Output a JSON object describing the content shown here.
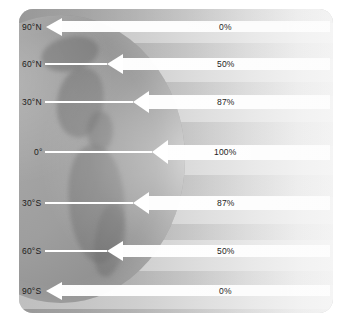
{
  "diagram": {
    "panel": {
      "corner_radius_px": 14
    },
    "globe": {
      "name": "earth-hemisphere"
    },
    "latitudes": [
      {
        "id": "90N",
        "label": "90°N",
        "y": 27,
        "label_x": 22,
        "line_x": 46,
        "line_w": 0,
        "beam_y": 21,
        "beam_h": 11,
        "tip_x": 46,
        "beam_x": 62,
        "beam_w": 268,
        "head_w": 16,
        "head_h": 9,
        "percent": "0%",
        "pct_x": 219,
        "pct_y": 27
      },
      {
        "id": "60N",
        "label": "60°N",
        "y": 64,
        "label_x": 22,
        "line_x": 45,
        "line_w": 62,
        "beam_y": 58,
        "beam_h": 12,
        "tip_x": 107,
        "beam_x": 123,
        "beam_w": 207,
        "head_w": 16,
        "head_h": 10,
        "percent": "50%",
        "pct_x": 217,
        "pct_y": 64
      },
      {
        "id": "30N",
        "label": "30°N",
        "y": 102,
        "label_x": 22,
        "line_x": 45,
        "line_w": 88,
        "beam_y": 95,
        "beam_h": 14,
        "tip_x": 133,
        "beam_x": 149,
        "beam_w": 181,
        "head_w": 16,
        "head_h": 11,
        "percent": "87%",
        "pct_x": 217,
        "pct_y": 102
      },
      {
        "id": "0",
        "label": "0°",
        "y": 152,
        "label_x": 34,
        "line_x": 45,
        "line_w": 107,
        "beam_y": 145,
        "beam_h": 15,
        "tip_x": 152,
        "beam_x": 168,
        "beam_w": 162,
        "head_w": 16,
        "head_h": 12,
        "percent": "100%",
        "pct_x": 214,
        "pct_y": 152
      },
      {
        "id": "30S",
        "label": "30°S",
        "y": 203,
        "label_x": 22,
        "line_x": 45,
        "line_w": 88,
        "beam_y": 196,
        "beam_h": 14,
        "tip_x": 133,
        "beam_x": 149,
        "beam_w": 181,
        "head_w": 16,
        "head_h": 11,
        "percent": "87%",
        "pct_x": 217,
        "pct_y": 203
      },
      {
        "id": "60S",
        "label": "60°S",
        "y": 251,
        "label_x": 22,
        "line_x": 45,
        "line_w": 62,
        "beam_y": 245,
        "beam_h": 12,
        "tip_x": 107,
        "beam_x": 123,
        "beam_w": 207,
        "head_w": 16,
        "head_h": 10,
        "percent": "50%",
        "pct_x": 217,
        "pct_y": 251
      },
      {
        "id": "90S",
        "label": "90°S",
        "y": 291,
        "label_x": 22,
        "line_x": 46,
        "line_w": 0,
        "beam_y": 285,
        "beam_h": 11,
        "tip_x": 46,
        "beam_x": 62,
        "beam_w": 268,
        "head_w": 16,
        "head_h": 9,
        "percent": "0%",
        "pct_x": 219,
        "pct_y": 291
      }
    ],
    "bands": [
      {
        "top": 0,
        "height": 14
      },
      {
        "top": 34,
        "height": 16
      },
      {
        "top": 73,
        "height": 14
      },
      {
        "top": 113,
        "height": 24
      },
      {
        "top": 166,
        "height": 22
      },
      {
        "top": 215,
        "height": 16
      },
      {
        "top": 262,
        "height": 14
      },
      {
        "top": 300,
        "height": 14
      }
    ],
    "colors": {
      "beam": "#ffffff",
      "label_text": "#1c1c1c",
      "globe_dark": "#8f8f8f",
      "panel_light": "#f2f2f2"
    }
  }
}
